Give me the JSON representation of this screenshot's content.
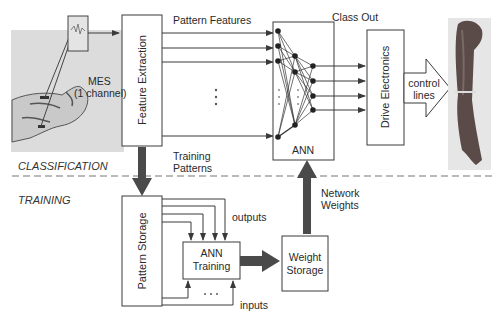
{
  "diagram": {
    "sections": {
      "classification": "CLASSIFICATION",
      "training": "TRAINING"
    },
    "blocks": {
      "feature_extraction": "Feature Extraction",
      "ann": "ANN",
      "drive_electronics": "Drive Electronics",
      "pattern_storage": "Pattern Storage",
      "ann_training_line1": "ANN",
      "ann_training_line2": "Training",
      "weight_storage_line1": "Weight",
      "weight_storage_line2": "Storage"
    },
    "labels": {
      "mes_line1": "MES",
      "mes_line2": "(1 channel)",
      "pattern_features": "Pattern Features",
      "class_out": "Class Out",
      "control_lines_line1": "control",
      "control_lines_line2": "lines",
      "training_patterns_line1": "Training",
      "training_patterns_line2": "Patterns",
      "network_weights_line1": "Network",
      "network_weights_line2": "Weights",
      "outputs": "outputs",
      "inputs": "inputs",
      "ellipsis": "• • •"
    },
    "images": {
      "left": "forearm-with-electrode-photo",
      "right": "prosthetic-arm-photo"
    },
    "colors": {
      "line": "#3a3a3a",
      "thick_arrow": "#4a4a4a",
      "photo_bg": "#dcdcdc",
      "arm": "#5a4a48",
      "dashed": "#777777"
    }
  }
}
